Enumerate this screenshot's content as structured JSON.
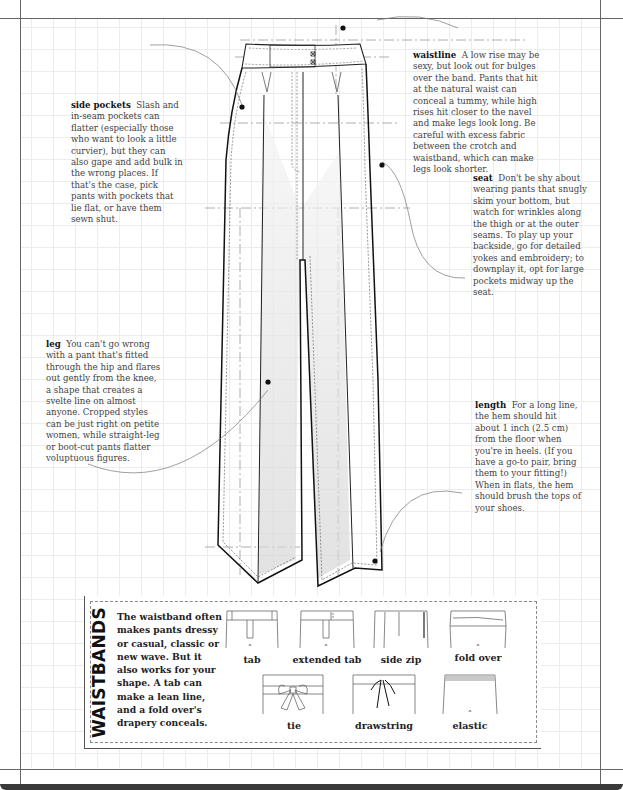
{
  "notes": {
    "waistline": {
      "term": "waistline",
      "text": "A low rise may be sexy, but look out for bulges over the band. Pants that hit at the natural waist can conceal a tummy, while high rises hit closer to the navel and make legs look long. Be careful with excess fabric between the crotch and waistband, which can make legs look shorter."
    },
    "side_pockets": {
      "term": "side pockets",
      "text": "Slash and in-seam pockets can flatter (especially those who want to look a little curvier), but they can also gape and add bulk in the wrong places. If that's the case, pick pants with pockets that lie flat, or have them sewn shut."
    },
    "seat": {
      "term": "seat",
      "text": "Don't be shy about wearing pants that snugly skim your bottom, but watch for wrinkles along the thigh or at the outer seams. To play up your backside, go for detailed yokes and embroidery; to downplay it, opt for large pockets midway up the seat."
    },
    "leg": {
      "term": "leg",
      "text": "You can't go wrong with a pant that's fitted through the hip and flares out gently from the knee, a shape that creates a svelte line on almost anyone. Cropped styles can be just right on petite women, while straight-leg or boot-cut pants flatter voluptuous figures."
    },
    "length": {
      "term": "length",
      "text": "For a long line, the hem should hit about 1 inch (2.5 cm) from the floor when you're in heels. (If you have a go-to pair, bring them to your fitting!) When in flats, the hem should brush the tops of your shoes."
    }
  },
  "waistbands": {
    "title": "WAISTBANDS",
    "description": "The waistband often makes pants dressy or casual, classic or new wave. But it also works for your shape. A tab can make a lean line, and a fold over's drapery conceals.",
    "styles": [
      {
        "label": "tab",
        "icon": "tab-waistband-icon"
      },
      {
        "label": "extended tab",
        "icon": "extended-tab-waistband-icon"
      },
      {
        "label": "side zip",
        "icon": "side-zip-waistband-icon"
      },
      {
        "label": "fold over",
        "icon": "fold-over-waistband-icon"
      },
      {
        "label": "tie",
        "icon": "tie-waistband-icon"
      },
      {
        "label": "drawstring",
        "icon": "drawstring-waistband-icon"
      },
      {
        "label": "elastic",
        "icon": "elastic-waistband-icon"
      }
    ]
  },
  "colors": {
    "grid": "#ececec",
    "frame": "#666666",
    "outline": "#111111",
    "shade": "#dcdcdc",
    "guide": "#9a9a9a"
  }
}
